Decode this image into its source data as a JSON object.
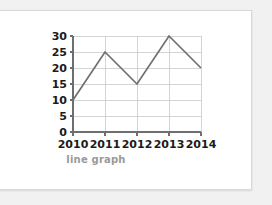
{
  "caption": "line graph",
  "chart_data": {
    "type": "line",
    "title": "",
    "subtitle": "",
    "xlabel": "",
    "ylabel": "",
    "categories": [
      "2010",
      "2011",
      "2012",
      "2013",
      "2014"
    ],
    "values": [
      10,
      25,
      15,
      30,
      20
    ],
    "series": [
      {
        "name": "line graph",
        "values": [
          10,
          25,
          15,
          30,
          20
        ]
      }
    ],
    "ylim": [
      0,
      30
    ],
    "y_ticks": [
      0,
      5,
      10,
      15,
      20,
      25,
      30
    ],
    "x_ticks": [
      "2010",
      "2011",
      "2012",
      "2013",
      "2014"
    ],
    "grid": true,
    "legend": false,
    "legend_position": "none",
    "line_color": "#6f6f6f",
    "grid_color": "#c9c9c9",
    "axis_color": "#6e6e6e",
    "label_color": "#1b1b1b",
    "caption_color": "#9a9a9a",
    "background_color": "#ffffff",
    "page_background_color": "#f1f1f1"
  }
}
